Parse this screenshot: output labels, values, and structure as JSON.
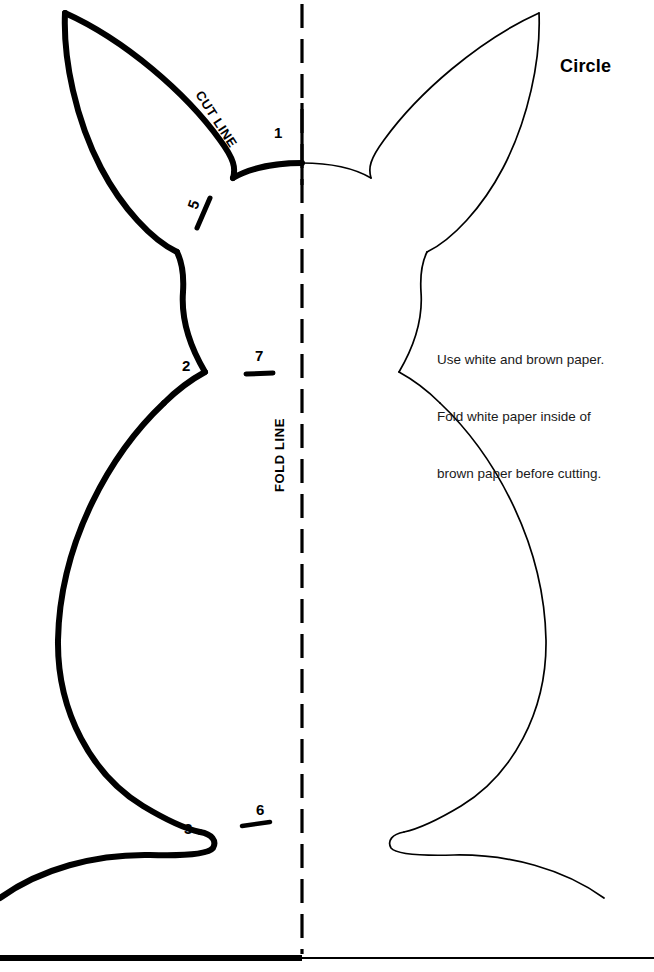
{
  "document": {
    "title": "Circle",
    "kind": "bunny-cut-and-fold-template",
    "background_color": "#ffffff",
    "ink_color": "#000000"
  },
  "labels": {
    "cut_line": "CUT LINE",
    "fold_line": "FOLD LINE"
  },
  "instructions": {
    "line1": "Use white and brown paper.",
    "line2": "Fold white paper inside of",
    "line3": "brown paper before cutting."
  },
  "markers": [
    {
      "id": "marker-1",
      "number": "1",
      "x": 279,
      "y": 133,
      "tick": "none"
    },
    {
      "id": "marker-5",
      "number": "5",
      "x": 196,
      "y": 205,
      "tick": "diagonal"
    },
    {
      "id": "marker-2",
      "number": "2",
      "x": 188,
      "y": 367,
      "tick": "none"
    },
    {
      "id": "marker-7",
      "number": "7",
      "x": 260,
      "y": 357,
      "tick": "horizontal"
    },
    {
      "id": "marker-3",
      "number": "3",
      "x": 190,
      "y": 830,
      "tick": "none"
    },
    {
      "id": "marker-6",
      "number": "6",
      "x": 261,
      "y": 812,
      "tick": "slanted"
    }
  ],
  "geometry": {
    "fold_line_x": 302,
    "baseline_y": 958,
    "thick_stroke_width": 6,
    "thin_stroke_width": 1.6,
    "fold_dash": "24 11",
    "canvas_width": 654,
    "canvas_height": 972
  }
}
